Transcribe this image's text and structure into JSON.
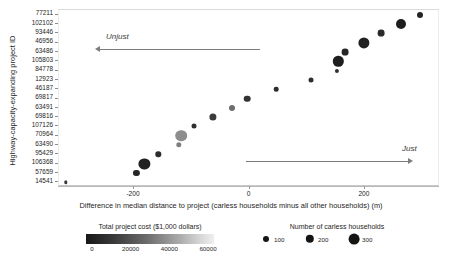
{
  "chart_data": {
    "type": "scatter",
    "title": "",
    "xlabel": "Difference in median distance to project (carless households minus all other households) (m)",
    "ylabel": "Highway-capacity-expanding project ID",
    "xlim": [
      -330,
      330
    ],
    "xticks": [
      -200,
      0,
      200
    ],
    "xticklabels": [
      "-200",
      "0",
      "200"
    ],
    "grid": false,
    "categories": [
      "77211",
      "102102",
      "93446",
      "46956",
      "63486",
      "105803",
      "84778",
      "12923",
      "46187",
      "69817",
      "63491",
      "69816",
      "107126",
      "70964",
      "63490",
      "95429",
      "106368",
      "57659",
      "14541"
    ],
    "points": [
      {
        "id": "77211",
        "x": 296,
        "cost": 9000,
        "households": 95,
        "size": 3.0,
        "color": "#242424"
      },
      {
        "id": "102102",
        "x": 262,
        "cost": 7000,
        "households": 230,
        "size": 5.0,
        "color": "#1d1d1d"
      },
      {
        "id": "93446",
        "x": 228,
        "cost": 11000,
        "households": 120,
        "size": 3.4,
        "color": "#2a2a2a"
      },
      {
        "id": "46956",
        "x": 198,
        "cost": 9000,
        "households": 280,
        "size": 5.6,
        "color": "#212121"
      },
      {
        "id": "63486",
        "x": 166,
        "cost": 8000,
        "households": 120,
        "size": 3.4,
        "color": "#262626"
      },
      {
        "id": "105803",
        "x": 154,
        "cost": 6000,
        "households": 250,
        "size": 5.2,
        "color": "#1f1f1f"
      },
      {
        "id": "84778",
        "x": 152,
        "cost": 5000,
        "households": 40,
        "size": 2.1,
        "color": "#303030"
      },
      {
        "id": "12923",
        "x": 106,
        "cost": 12000,
        "households": 60,
        "size": 2.5,
        "color": "#2e2e2e"
      },
      {
        "id": "46187",
        "x": 46,
        "cost": 10000,
        "households": 50,
        "size": 2.3,
        "color": "#2c2c2c"
      },
      {
        "id": "69817",
        "x": -4,
        "cost": 13000,
        "households": 110,
        "size": 3.3,
        "color": "#333333"
      },
      {
        "id": "63491",
        "x": -30,
        "cost": 31000,
        "households": 90,
        "size": 3.0,
        "color": "#6e6e6e"
      },
      {
        "id": "69816",
        "x": -64,
        "cost": 15000,
        "households": 130,
        "size": 3.6,
        "color": "#3b3b3b"
      },
      {
        "id": "107126",
        "x": -96,
        "cost": 14000,
        "households": 60,
        "size": 2.5,
        "color": "#2f2f2f"
      },
      {
        "id": "70964",
        "x": -118,
        "cost": 41000,
        "households": 300,
        "size": 5.8,
        "color": "#8d8d8d"
      },
      {
        "id": "63490",
        "x": -122,
        "cost": 38000,
        "households": 70,
        "size": 2.7,
        "color": "#7f7f7f"
      },
      {
        "id": "95429",
        "x": -158,
        "cost": 12000,
        "households": 70,
        "size": 2.7,
        "color": "#2d2d2d"
      },
      {
        "id": "106368",
        "x": -182,
        "cost": 8000,
        "households": 290,
        "size": 5.6,
        "color": "#222222"
      },
      {
        "id": "57659",
        "x": -196,
        "cost": 10000,
        "households": 100,
        "size": 3.1,
        "color": "#272727"
      },
      {
        "id": "14541",
        "x": -318,
        "cost": 7000,
        "households": 25,
        "size": 1.7,
        "color": "#3a3a3a"
      }
    ],
    "annotations": [
      {
        "text": "Unjust",
        "direction": "left"
      },
      {
        "text": "Just",
        "direction": "right"
      }
    ],
    "legends": {
      "color": {
        "title": "Total project cost ($1,000 dollars)",
        "ticks": [
          "0",
          "20000",
          "40000",
          "60000"
        ],
        "range": [
          0,
          60000
        ],
        "low_color": "#171717",
        "high_color": "#efefef"
      },
      "size": {
        "title": "Number of carless households",
        "entries": [
          "100",
          "200",
          "300"
        ]
      }
    }
  }
}
